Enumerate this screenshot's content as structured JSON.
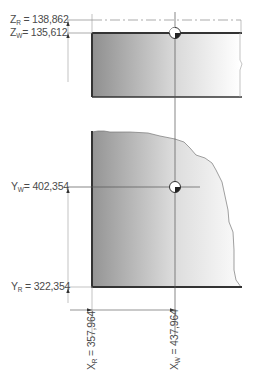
{
  "diagram": {
    "labels": {
      "z_r": {
        "axis": "Z",
        "sub": "R",
        "value": "= 138,862"
      },
      "z_w": {
        "axis": "Z",
        "sub": "W",
        "value": "= 135,612"
      },
      "y_w": {
        "axis": "Y",
        "sub": "W",
        "value": "= 402,354"
      },
      "y_r": {
        "axis": "Y",
        "sub": "R",
        "value": "= 322,354"
      },
      "x_r": {
        "axis": "X",
        "sub": "R",
        "value": "= 357,964"
      },
      "x_w": {
        "axis": "X",
        "sub": "W",
        "value": "= 437,964"
      }
    },
    "markers": [
      {
        "name": "workpiece-zero-side-view",
        "x": 175,
        "y": 33
      },
      {
        "name": "workpiece-zero-top-view",
        "x": 175,
        "y": 187
      }
    ],
    "colors": {
      "line": "#333333",
      "thin_line": "#666666",
      "dim_line": "#555555",
      "gradient_dark": "#8c8c8c",
      "gradient_light": "#ffffff"
    }
  }
}
